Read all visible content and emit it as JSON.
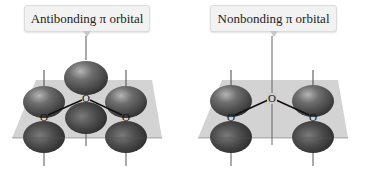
{
  "diagrams": [
    {
      "id": "antibonding",
      "label": "Antibonding π orbital",
      "atoms": [
        {
          "symbol": "O",
          "position": "left"
        },
        {
          "symbol": "O",
          "position": "center"
        },
        {
          "symbol": "O",
          "position": "right"
        }
      ],
      "lobes_on": [
        "left",
        "center",
        "right"
      ]
    },
    {
      "id": "nonbonding",
      "label": "Nonbonding π orbital",
      "atoms": [
        {
          "symbol": "O",
          "position": "left"
        },
        {
          "symbol": "O",
          "position": "center"
        },
        {
          "symbol": "O",
          "position": "right"
        }
      ],
      "lobes_on": [
        "left",
        "right"
      ]
    }
  ],
  "colors": {
    "plane": "#bdbdbd",
    "lobe_dark": "#3a3a3a",
    "lobe_light": "#9a9a9a",
    "bond": "#111111",
    "label_bg": "#f2f2f2"
  }
}
